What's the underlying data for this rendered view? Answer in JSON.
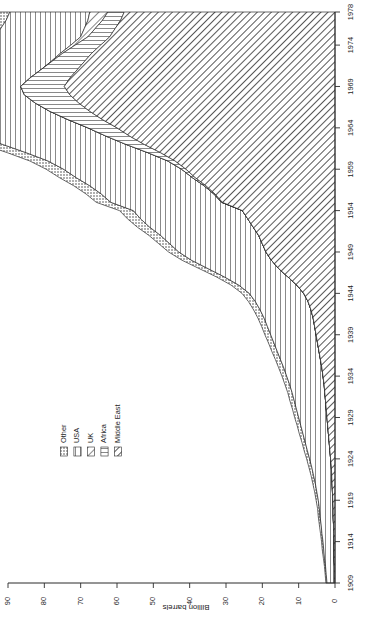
{
  "figure": {
    "orientation": "rotated-90",
    "background": "#ffffff",
    "ink_color": "#1d1d1d"
  },
  "chart_data": {
    "type": "area",
    "title": "",
    "subtitle": "",
    "xlabel": "",
    "ylabel": "Billion barrels",
    "stacked": true,
    "grid": false,
    "legend_position": "left-middle",
    "xlim": [
      1909,
      1978
    ],
    "ylim": [
      0,
      90
    ],
    "x_tick_labels": [
      "1909",
      "1914",
      "1919",
      "1924",
      "1929",
      "1934",
      "1939",
      "1944",
      "1949",
      "1954",
      "1959",
      "1964",
      "1969",
      "1974",
      "1978"
    ],
    "x_ticks": [
      1909,
      1914,
      1919,
      1924,
      1929,
      1934,
      1939,
      1944,
      1949,
      1954,
      1959,
      1964,
      1969,
      1974,
      1978
    ],
    "y_tick_labels": [
      "0",
      "10",
      "20",
      "30",
      "40",
      "50",
      "60",
      "70",
      "80",
      "90"
    ],
    "y_ticks": [
      0,
      10,
      20,
      30,
      40,
      50,
      60,
      70,
      80,
      90
    ],
    "x": [
      1909,
      1910,
      1911,
      1912,
      1913,
      1914,
      1915,
      1916,
      1917,
      1918,
      1919,
      1920,
      1921,
      1922,
      1923,
      1924,
      1925,
      1926,
      1927,
      1928,
      1929,
      1930,
      1931,
      1932,
      1933,
      1934,
      1935,
      1936,
      1937,
      1938,
      1939,
      1940,
      1941,
      1942,
      1943,
      1944,
      1945,
      1946,
      1947,
      1948,
      1949,
      1950,
      1951,
      1952,
      1953,
      1954,
      1955,
      1956,
      1957,
      1958,
      1959,
      1960,
      1961,
      1962,
      1963,
      1964,
      1965,
      1966,
      1967,
      1968,
      1969,
      1970,
      1971,
      1972,
      1973,
      1974,
      1975,
      1976,
      1977,
      1978
    ],
    "series": [
      {
        "name": "Middle East",
        "pattern": "diagonal-hatch-dense",
        "values": [
          0.2,
          0.2,
          0.2,
          0.3,
          0.3,
          0.3,
          0.4,
          0.4,
          0.5,
          0.5,
          0.6,
          0.7,
          0.8,
          0.9,
          1.0,
          1.2,
          1.4,
          1.6,
          1.8,
          2.0,
          2.2,
          2.4,
          2.6,
          2.8,
          3.0,
          3.3,
          3.6,
          4.0,
          4.4,
          4.8,
          5.2,
          5.6,
          6.0,
          6.6,
          7.4,
          8.6,
          10.5,
          13.0,
          15.5,
          17.5,
          19.0,
          20.0,
          21.0,
          22.5,
          24.0,
          25.5,
          31.0,
          33.0,
          35.5,
          38.5,
          41.0,
          44.0,
          48.0,
          52.5,
          56.5,
          60.0,
          64.0,
          67.5,
          70.5,
          73.0,
          74.5,
          73.0,
          71.0,
          69.0,
          67.0,
          64.5,
          62.0,
          60.5,
          59.0,
          58.0
        ]
      },
      {
        "name": "Africa",
        "pattern": "vertical-lines-dotted",
        "values": [
          0,
          0,
          0,
          0,
          0,
          0,
          0,
          0,
          0,
          0,
          0,
          0,
          0,
          0,
          0,
          0,
          0,
          0,
          0,
          0,
          0,
          0,
          0,
          0,
          0,
          0,
          0,
          0,
          0,
          0,
          0,
          0,
          0,
          0,
          0,
          0,
          0,
          0,
          0,
          0,
          0,
          0,
          0,
          0,
          0,
          0,
          0.2,
          0.3,
          0.5,
          0.8,
          1.2,
          2.0,
          3.5,
          5.0,
          6.5,
          8.0,
          9.5,
          11.0,
          12.0,
          12.5,
          12.0,
          11.0,
          10.0,
          9.0,
          8.0,
          7.0,
          6.0,
          5.5,
          5.0,
          4.5
        ]
      },
      {
        "name": "UK",
        "pattern": "diagonal-hatch",
        "values": [
          0,
          0,
          0,
          0,
          0,
          0,
          0,
          0,
          0,
          0,
          0,
          0,
          0,
          0,
          0,
          0,
          0,
          0,
          0,
          0,
          0,
          0,
          0,
          0,
          0,
          0,
          0,
          0,
          0,
          0,
          0,
          0,
          0,
          0,
          0,
          0,
          0,
          0,
          0,
          0,
          0,
          0,
          0,
          0,
          0,
          0,
          0,
          0,
          0,
          0,
          0,
          0,
          0,
          0,
          0,
          0,
          0,
          0,
          0,
          0,
          0,
          0,
          0,
          0.2,
          0.6,
          1.2,
          2.0,
          3.0,
          4.0,
          5.0
        ]
      },
      {
        "name": "USA",
        "pattern": "vertical-lines",
        "values": [
          2.0,
          2.2,
          2.4,
          2.6,
          2.8,
          3.0,
          3.2,
          3.4,
          3.6,
          3.8,
          4.0,
          4.3,
          4.6,
          5.0,
          5.4,
          5.8,
          6.2,
          6.6,
          7.0,
          7.4,
          7.8,
          8.2,
          8.6,
          9.0,
          9.5,
          10.0,
          10.5,
          11.0,
          11.5,
          12.0,
          12.5,
          13.0,
          13.5,
          14.0,
          14.5,
          15.0,
          16.0,
          17.5,
          19.5,
          22.0,
          24.0,
          25.5,
          27.0,
          28.5,
          29.5,
          30.0,
          30.5,
          31.0,
          31.5,
          32.0,
          32.5,
          33.0,
          33.5,
          34.0,
          34.5,
          35.0,
          35.0,
          34.5,
          34.0,
          33.0,
          32.0,
          30.5,
          29.0,
          27.5,
          26.0,
          25.0,
          24.0,
          23.0,
          22.5,
          22.0
        ]
      },
      {
        "name": "Other",
        "pattern": "dotted",
        "values": [
          0.3,
          0.3,
          0.3,
          0.3,
          0.4,
          0.4,
          0.4,
          0.5,
          0.5,
          0.5,
          0.6,
          0.6,
          0.7,
          0.7,
          0.8,
          0.8,
          0.9,
          0.9,
          1.0,
          1.0,
          1.1,
          1.1,
          1.2,
          1.2,
          1.3,
          1.3,
          1.4,
          1.4,
          1.5,
          1.5,
          1.6,
          1.6,
          1.7,
          1.8,
          1.9,
          2.0,
          2.1,
          2.2,
          2.4,
          2.6,
          2.8,
          3.0,
          3.2,
          3.4,
          3.6,
          3.8,
          4.0,
          4.2,
          4.4,
          4.6,
          4.8,
          5.0,
          5.2,
          5.4,
          5.6,
          5.8,
          6.0,
          6.2,
          6.4,
          6.6,
          6.8,
          7.0,
          7.2,
          7.4,
          7.6,
          7.8,
          8.0,
          8.2,
          8.4,
          8.6
        ]
      }
    ]
  },
  "axes": {
    "value_axis_title": "Billion barrels",
    "value_axis_ticks": [
      "90",
      "80",
      "70",
      "60",
      "50",
      "40",
      "30",
      "20",
      "10",
      "0"
    ],
    "year_axis_ticks": [
      "1978",
      "1974",
      "1969",
      "1964",
      "1959",
      "1954",
      "1949",
      "1944",
      "1939",
      "1934",
      "1929",
      "1924",
      "1919",
      "1914",
      "1909"
    ]
  },
  "legend": {
    "items": [
      {
        "label": "Other",
        "pattern": "dotted"
      },
      {
        "label": "USA",
        "pattern": "vertical-lines"
      },
      {
        "label": "UK",
        "pattern": "diagonal-hatch"
      },
      {
        "label": "Africa",
        "pattern": "vertical-lines-dotted"
      },
      {
        "label": "Middle East",
        "pattern": "diagonal-hatch-dense"
      }
    ]
  }
}
